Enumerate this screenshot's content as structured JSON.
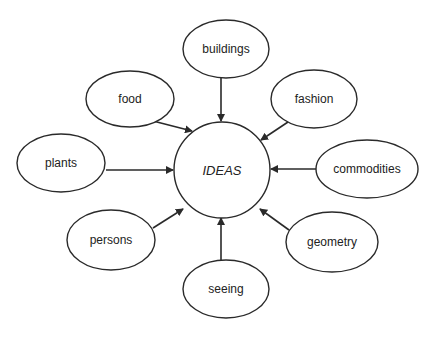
{
  "diagram": {
    "title": "",
    "colors": {
      "stroke": "#2a2a2a",
      "fill": "#ffffff",
      "text": "#222222"
    },
    "center": {
      "label": "IDEAS",
      "cx": 222,
      "cy": 170,
      "rx": 48,
      "ry": 48
    },
    "nodes": [
      {
        "id": "buildings",
        "label": "buildings",
        "cx": 226,
        "cy": 49,
        "rx": 43,
        "ry": 29
      },
      {
        "id": "food",
        "label": "food",
        "cx": 130,
        "cy": 99,
        "rx": 44,
        "ry": 28
      },
      {
        "id": "fashion",
        "label": "fashion",
        "cx": 314,
        "cy": 99,
        "rx": 43,
        "ry": 29
      },
      {
        "id": "plants",
        "label": "plants",
        "cx": 61,
        "cy": 163,
        "rx": 44,
        "ry": 29
      },
      {
        "id": "commodities",
        "label": "commodities",
        "cx": 367,
        "cy": 169,
        "rx": 51,
        "ry": 29
      },
      {
        "id": "persons",
        "label": "persons",
        "cx": 111,
        "cy": 240,
        "rx": 44,
        "ry": 30
      },
      {
        "id": "geometry",
        "label": "geometry",
        "cx": 332,
        "cy": 242,
        "rx": 46,
        "ry": 30
      },
      {
        "id": "seeing",
        "label": "seeing",
        "cx": 226,
        "cy": 289,
        "rx": 43,
        "ry": 29
      }
    ],
    "edges": [
      {
        "from": "buildings",
        "to": "IDEAS",
        "x1": 221,
        "y1": 78,
        "x2": 221,
        "y2": 121
      },
      {
        "from": "food",
        "to": "IDEAS",
        "x1": 153,
        "y1": 121,
        "x2": 192,
        "y2": 131
      },
      {
        "from": "fashion",
        "to": "IDEAS",
        "x1": 288,
        "y1": 122,
        "x2": 261,
        "y2": 140
      },
      {
        "from": "plants",
        "to": "IDEAS",
        "x1": 106,
        "y1": 170,
        "x2": 173,
        "y2": 170
      },
      {
        "from": "commodities",
        "to": "IDEAS",
        "x1": 318,
        "y1": 169,
        "x2": 271,
        "y2": 169
      },
      {
        "from": "persons",
        "to": "IDEAS",
        "x1": 153,
        "y1": 228,
        "x2": 183,
        "y2": 209
      },
      {
        "from": "geometry",
        "to": "IDEAS",
        "x1": 289,
        "y1": 230,
        "x2": 260,
        "y2": 209
      },
      {
        "from": "seeing",
        "to": "IDEAS",
        "x1": 221,
        "y1": 260,
        "x2": 221,
        "y2": 218
      }
    ]
  }
}
